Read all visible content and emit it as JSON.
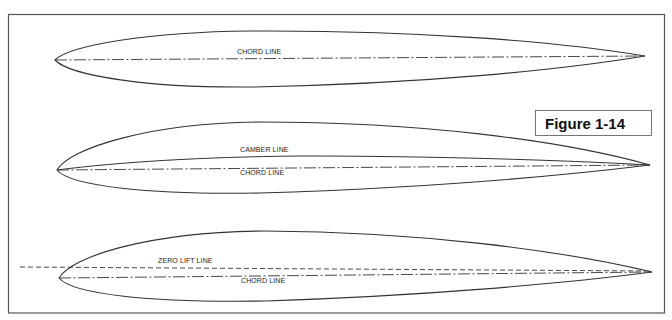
{
  "figure": {
    "label": "Figure 1-14",
    "border_color": "#555555",
    "line_color": "#333333"
  },
  "airfoils": [
    {
      "name": "symmetric",
      "labels": {
        "chord": "CHORD LINE"
      },
      "leading_edge": [
        55,
        60
      ],
      "trailing_edge": [
        645,
        56
      ]
    },
    {
      "name": "cambered",
      "labels": {
        "camber": "CAMBER LINE",
        "chord": "CHORD LINE"
      },
      "leading_edge": [
        57,
        170
      ],
      "trailing_edge": [
        650,
        165
      ]
    },
    {
      "name": "zero-lift",
      "labels": {
        "zero_lift": "ZERO LIFT LINE",
        "chord": "CHORD LINE"
      },
      "leading_edge": [
        59,
        278
      ],
      "trailing_edge": [
        652,
        272
      ]
    }
  ]
}
